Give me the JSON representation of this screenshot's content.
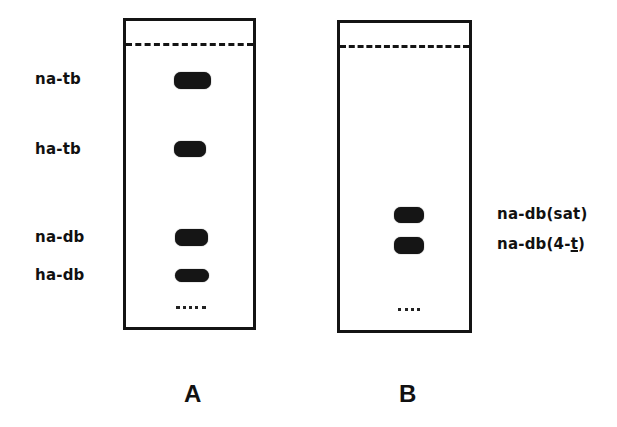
{
  "figure": {
    "panels": [
      {
        "id": "A",
        "letter": "A",
        "spots": [
          {
            "label": "na-tb",
            "rel_position": "top"
          },
          {
            "label": "ha-tb",
            "rel_position": "upper-middle"
          },
          {
            "label": "na-db",
            "rel_position": "lower-middle"
          },
          {
            "label": "ha-db",
            "rel_position": "lower"
          }
        ]
      },
      {
        "id": "B",
        "letter": "B",
        "spots": [
          {
            "label": "na-db(sat)",
            "rel_position": "middle"
          },
          {
            "label_prefix": "na-db(4-",
            "label_underlined": "t",
            "label_suffix": ")",
            "rel_position": "lower-middle"
          }
        ]
      }
    ],
    "legend_marks": {
      "solvent_front": "dashed line",
      "origin": "dotted line"
    }
  }
}
